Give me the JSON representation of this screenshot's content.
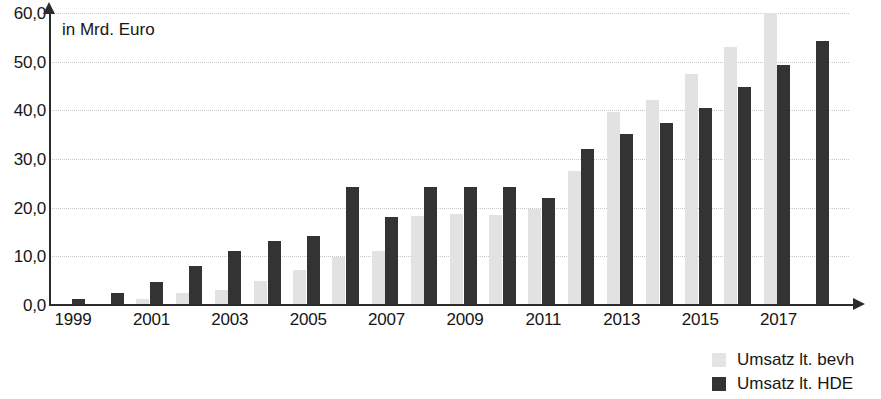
{
  "chart_data": {
    "type": "bar",
    "title": "",
    "subtitle": "",
    "axis_caption": "in Mrd. Euro",
    "xlabel": "",
    "ylabel": "in Mrd. Euro",
    "ylim": [
      0,
      60
    ],
    "ytick_values": [
      0,
      10,
      20,
      30,
      40,
      50,
      60
    ],
    "ytick_labels": [
      "0,0",
      "10,0",
      "20,0",
      "30,0",
      "40,0",
      "50,0",
      "60,0"
    ],
    "grid": true,
    "grid_axis": "y",
    "legend_position": "bottom-right",
    "categories": [
      "1999",
      "2000",
      "2001",
      "2002",
      "2003",
      "2004",
      "2005",
      "2006",
      "2007",
      "2008",
      "2009",
      "2010",
      "2011",
      "2012",
      "2013",
      "2014",
      "2015",
      "2016",
      "2017",
      "2018"
    ],
    "xtick_labels": [
      "1999",
      "2001",
      "2003",
      "2005",
      "2007",
      "2009",
      "2011",
      "2013",
      "2015",
      "2017"
    ],
    "series": [
      {
        "name": "Umsatz lt. bevh",
        "color": "#e2e2e2",
        "values": [
          null,
          null,
          1.3,
          2.5,
          3.0,
          5.0,
          7.2,
          9.8,
          11.0,
          18.3,
          18.7,
          18.4,
          19.7,
          27.6,
          39.6,
          42.2,
          47.5,
          53.0,
          60.0,
          null
        ]
      },
      {
        "name": "Umsatz lt. HDE",
        "color": "#333333",
        "values": [
          1.3,
          2.5,
          4.8,
          8.0,
          11.0,
          13.1,
          14.1,
          24.2,
          18.0,
          24.2,
          24.2,
          24.2,
          22.0,
          32.0,
          35.1,
          37.3,
          40.5,
          44.8,
          49.4,
          54.2
        ]
      }
    ]
  },
  "legend": {
    "items": [
      {
        "label": "Umsatz lt. bevh",
        "swatch": "light-gray-swatch"
      },
      {
        "label": "Umsatz lt. HDE",
        "swatch": "dark-gray-swatch"
      }
    ]
  }
}
